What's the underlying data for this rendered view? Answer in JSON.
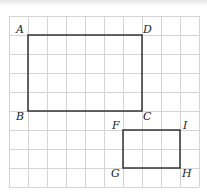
{
  "diagram": {
    "grid": {
      "cols": 10,
      "rows": 9,
      "origin_x": 9,
      "origin_y": 16,
      "cell": 19,
      "line_color": "#d4d4d4"
    },
    "shape_color": "#333333",
    "rectangles": [
      {
        "name": "ABCD",
        "vertices": {
          "A": [
            1,
            1
          ],
          "D": [
            7,
            1
          ],
          "C": [
            7,
            5
          ],
          "B": [
            1,
            5
          ]
        }
      },
      {
        "name": "FIHG",
        "vertices": {
          "F": [
            6,
            6
          ],
          "I": [
            9,
            6
          ],
          "H": [
            9,
            8
          ],
          "G": [
            6,
            8
          ]
        }
      }
    ],
    "labels": {
      "A": "A",
      "B": "B",
      "C": "C",
      "D": "D",
      "F": "F",
      "G": "G",
      "H": "H",
      "I": "I"
    }
  }
}
